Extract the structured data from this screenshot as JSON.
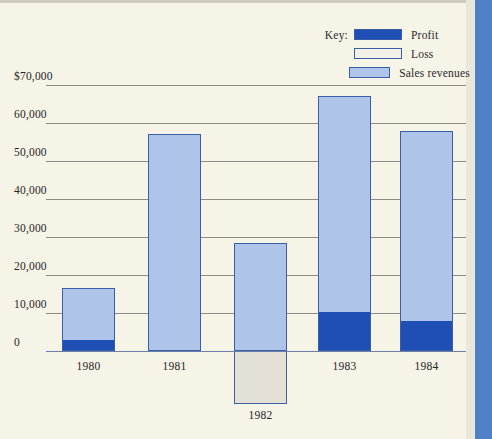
{
  "legend": {
    "key_label": "Key:",
    "entries": [
      {
        "name": "profit-swatch",
        "label": "Profit",
        "color": "#1f4fb5"
      },
      {
        "name": "loss-swatch",
        "label": "Loss",
        "color": "#f2f0e7"
      },
      {
        "name": "sales-revenues-swatch",
        "label": "Sales revenues",
        "color": "#aec4e8"
      }
    ]
  },
  "chart_data": {
    "type": "bar",
    "title": "",
    "xlabel": "",
    "ylabel": "",
    "categories": [
      "1980",
      "1981",
      "1982",
      "1983",
      "1984"
    ],
    "ytick_labels": [
      "$70,000",
      "60,000",
      "50,000",
      "40,000",
      "30,000",
      "20,000",
      "10,000",
      "0"
    ],
    "ytick_values": [
      70000,
      60000,
      50000,
      40000,
      30000,
      20000,
      10000,
      0
    ],
    "ylim": [
      -15000,
      72000
    ],
    "grid": true,
    "legend_position": "top-right",
    "series": [
      {
        "name": "Sales revenues",
        "color": "#aec4e8",
        "values": [
          16500,
          57000,
          28500,
          67000,
          58000
        ]
      },
      {
        "name": "Profit",
        "color": "#1f4fb5",
        "values": [
          2500,
          0,
          0,
          10000,
          7500
        ]
      },
      {
        "name": "Loss",
        "color": "#e3e1d6",
        "values": [
          0,
          0,
          -14000,
          0,
          0
        ]
      }
    ]
  }
}
